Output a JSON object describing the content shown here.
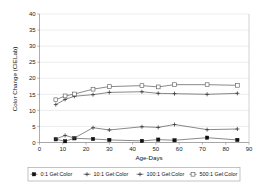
{
  "chart_data": {
    "type": "line",
    "title": "",
    "xlabel": "Age-Days",
    "ylabel": "Color Change (CIELab)",
    "xlim": [
      0,
      90
    ],
    "ylim": [
      0,
      40
    ],
    "xticks": [
      0,
      10,
      20,
      30,
      40,
      50,
      60,
      70,
      80,
      90
    ],
    "yticks": [
      0,
      5,
      10,
      15,
      20,
      25,
      30,
      35,
      40
    ],
    "grid": true,
    "legend_position": "bottom",
    "x": [
      7,
      11,
      15,
      23,
      30,
      44,
      51,
      58,
      72,
      85
    ],
    "series": [
      {
        "name": "0:1 Gel:Color",
        "marker": "filled-square",
        "values": [
          1.0,
          0.4,
          1.3,
          1.1,
          0.8,
          0.5,
          0.9,
          0.7,
          1.5,
          0.8
        ]
      },
      {
        "name": "10:1 Gel:Color",
        "marker": "plus",
        "values": [
          1.1,
          2.2,
          1.4,
          4.6,
          3.9,
          4.9,
          4.7,
          5.6,
          4.0,
          4.2
        ]
      },
      {
        "name": "100:1 Gel:Color",
        "marker": "plus",
        "values": [
          11.8,
          13.4,
          14.4,
          14.9,
          15.6,
          15.8,
          15.3,
          15.2,
          15.0,
          15.3
        ]
      },
      {
        "name": "500:1 Gel:Color",
        "marker": "open-square",
        "values": [
          13.3,
          14.5,
          15.1,
          16.6,
          17.4,
          17.7,
          17.3,
          18.0,
          18.0,
          17.8
        ]
      }
    ]
  },
  "axes": {
    "x_title": "Age-Days",
    "y_title": "Color Change (CIELab)",
    "x_tick_labels": [
      "0",
      "10",
      "20",
      "30",
      "40",
      "50",
      "60",
      "70",
      "80",
      "90"
    ],
    "y_tick_labels": [
      "0",
      "5",
      "10",
      "15",
      "20",
      "25",
      "30",
      "35",
      "40"
    ]
  },
  "legend": {
    "entries": [
      {
        "label": "0:1 Gel:Color",
        "marker": "filled-square"
      },
      {
        "label": "10:1 Gel:Color",
        "marker": "plus"
      },
      {
        "label": "100:1 Gel:Color",
        "marker": "plus"
      },
      {
        "label": "500:1 Gel:Color",
        "marker": "open-square"
      }
    ]
  },
  "colors": {
    "background": "#ffffff",
    "grid": "#d9d9d9",
    "axis": "#8a8a8a",
    "line": "#4a4a4a",
    "marker_dark": "#111111"
  }
}
